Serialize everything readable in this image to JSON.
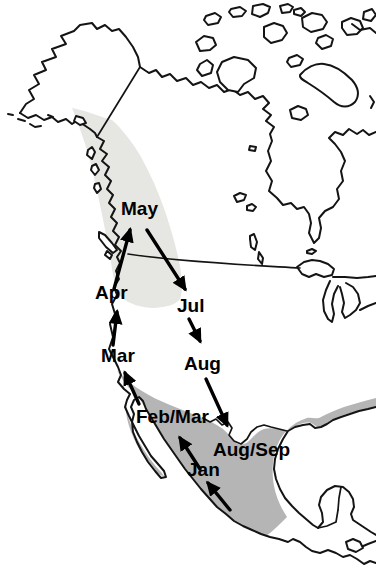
{
  "map": {
    "type": "migration-route-map",
    "region_shown": "North America (Alaska and Canada to Mexico and Central America)",
    "colors": {
      "background": "#ffffff",
      "outline": "#141414",
      "light_shaded_range": "#e6e7e2",
      "dark_shaded_range": "#b5b5b5",
      "arrow": "#000000",
      "label_text": "#000000"
    },
    "labels": {
      "may": "May",
      "apr": "Apr",
      "jul": "Jul",
      "mar": "Mar",
      "aug": "Aug",
      "feb_mar": "Feb/Mar",
      "aug_sep": "Aug/Sep",
      "jan": "Jan"
    },
    "arrows": [
      {
        "from": "Mar",
        "to": "Apr",
        "direction": "north"
      },
      {
        "from": "Apr",
        "to": "May",
        "direction": "north"
      },
      {
        "from": "May",
        "to": "Jul",
        "direction": "southeast"
      },
      {
        "from": "Jul",
        "to": "Aug",
        "direction": "south"
      },
      {
        "from": "Aug",
        "to": "Aug/Sep",
        "direction": "southeast"
      },
      {
        "from": null,
        "to": "Jan",
        "direction": "northwest"
      },
      {
        "from": "Jan",
        "to": "Feb/Mar",
        "direction": "northwest"
      },
      {
        "from": "Feb/Mar",
        "to": "Mar",
        "direction": "northwest"
      }
    ],
    "shaded_regions": [
      {
        "id": "light_shaded_range",
        "location": "Pacific Northwest coast from southeast Alaska through British Columbia to the northwest United States"
      },
      {
        "id": "dark_shaded_range",
        "location": "Southern California coast, Baja California, western and central Mexico, and the Gulf of Mexico coast"
      }
    ]
  }
}
